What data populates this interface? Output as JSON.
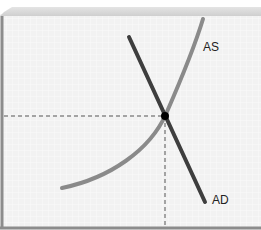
{
  "diagram": {
    "type": "aggregate supply / aggregate demand",
    "curves": [
      {
        "label": "AS",
        "color": "#8a8a8a",
        "shape": "upward-sloping convex"
      },
      {
        "label": "AD",
        "color": "#3e3e3e",
        "shape": "downward-sloping straight line"
      }
    ],
    "equilibrium_point": {
      "color": "#000000"
    },
    "colors": {
      "background": "#f3f3f3",
      "grid": "#ffffff",
      "top_band": "#d6d6d6",
      "axis": "#8c8c8c",
      "guides": "#555555"
    }
  },
  "labels": {
    "as": "AS",
    "ad": "AD"
  }
}
